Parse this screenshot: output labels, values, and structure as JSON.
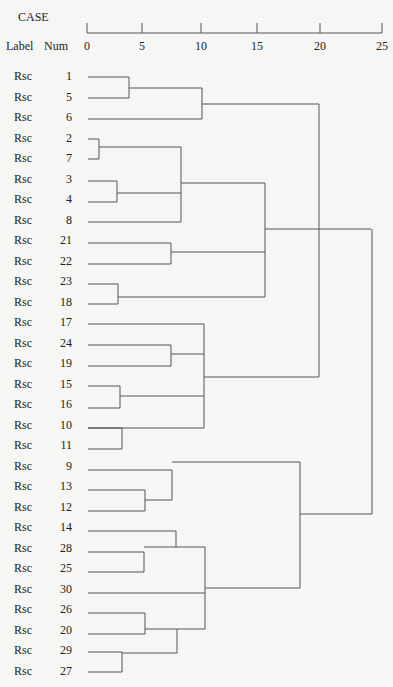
{
  "header": {
    "case_label": "CASE",
    "label_col": "Label",
    "num_col": "Num"
  },
  "chart_data": {
    "type": "dendrogram",
    "title": "",
    "axis": {
      "label": "Rescaled distance",
      "ticks": [
        0,
        5,
        10,
        15,
        20,
        25
      ],
      "range": [
        0,
        25
      ]
    },
    "leaves": [
      {
        "label": "Rsc",
        "num": "1"
      },
      {
        "label": "Rsc",
        "num": "5"
      },
      {
        "label": "Rsc",
        "num": "6"
      },
      {
        "label": "Rsc",
        "num": "2"
      },
      {
        "label": "Rsc",
        "num": "7"
      },
      {
        "label": "Rsc",
        "num": "3"
      },
      {
        "label": "Rsc",
        "num": "4"
      },
      {
        "label": "Rsc",
        "num": "8"
      },
      {
        "label": "Rsc",
        "num": "21"
      },
      {
        "label": "Rsc",
        "num": "22"
      },
      {
        "label": "Rsc",
        "num": "23"
      },
      {
        "label": "Rsc",
        "num": "18"
      },
      {
        "label": "Rsc",
        "num": "17"
      },
      {
        "label": "Rsc",
        "num": "24"
      },
      {
        "label": "Rsc",
        "num": "19"
      },
      {
        "label": "Rsc",
        "num": "15"
      },
      {
        "label": "Rsc",
        "num": "16"
      },
      {
        "label": "Rsc",
        "num": "10"
      },
      {
        "label": "Rsc",
        "num": "11"
      },
      {
        "label": "Rsc",
        "num": "9"
      },
      {
        "label": "Rsc",
        "num": "13"
      },
      {
        "label": "Rsc",
        "num": "12"
      },
      {
        "label": "Rsc",
        "num": "14"
      },
      {
        "label": "Rsc",
        "num": "28"
      },
      {
        "label": "Rsc",
        "num": "25"
      },
      {
        "label": "Rsc",
        "num": "30"
      },
      {
        "label": "Rsc",
        "num": "26"
      },
      {
        "label": "Rsc",
        "num": "20"
      },
      {
        "label": "Rsc",
        "num": "29"
      },
      {
        "label": "Rsc",
        "num": "27"
      }
    ],
    "merges": [
      {
        "members": [
          "1",
          "5"
        ],
        "distance": 3.7
      },
      {
        "members": [
          "1,5",
          "6"
        ],
        "distance": 10.0
      },
      {
        "members": [
          "2",
          "7"
        ],
        "distance": 1.0
      },
      {
        "members": [
          "3",
          "4"
        ],
        "distance": 2.6
      },
      {
        "members": [
          "2,7",
          "3,4",
          "8"
        ],
        "distance": 8.3
      },
      {
        "members": [
          "21",
          "22"
        ],
        "distance": 7.4
      },
      {
        "members": [
          "23",
          "18"
        ],
        "distance": 2.7
      },
      {
        "members": [
          "2..8",
          "21,22",
          "23,18"
        ],
        "distance": 15.5
      },
      {
        "members": [
          "24",
          "19"
        ],
        "distance": 7.4
      },
      {
        "members": [
          "15",
          "16"
        ],
        "distance": 2.9
      },
      {
        "members": [
          "10",
          "11"
        ],
        "distance": 3.0
      },
      {
        "members": [
          "17",
          "24,19",
          "15,16",
          "10,11"
        ],
        "distance": 10.2
      },
      {
        "members": [
          "1,5,6",
          "17..11"
        ],
        "distance": 20.4
      },
      {
        "members": [
          "13",
          "12"
        ],
        "distance": 5.0
      },
      {
        "members": [
          "9",
          "13,12"
        ],
        "distance": 7.6
      },
      {
        "members": [
          "28",
          "25"
        ],
        "distance": 4.9
      },
      {
        "members": [
          "14",
          "28,25"
        ],
        "distance": 7.9
      },
      {
        "members": [
          "26",
          "20"
        ],
        "distance": 5.0
      },
      {
        "members": [
          "29",
          "27"
        ],
        "distance": 3.0
      },
      {
        "members": [
          "26,20",
          "29,27"
        ],
        "distance": 7.9
      },
      {
        "members": [
          "14,28,25",
          "30",
          "26..27"
        ],
        "distance": 10.3
      },
      {
        "members": [
          "9,13,12",
          "14..27"
        ],
        "distance": 18.7
      },
      {
        "members": [
          "upper",
          "lower"
        ],
        "distance": 24.8
      }
    ],
    "segments": [
      [
        88,
        77,
        129,
        77
      ],
      [
        88,
        98,
        129,
        98
      ],
      [
        129,
        77,
        129,
        98
      ],
      [
        129,
        88,
        202,
        88
      ],
      [
        88,
        119,
        202,
        119
      ],
      [
        202,
        88,
        202,
        119
      ],
      [
        202,
        104,
        319,
        104
      ],
      [
        88,
        139,
        99,
        139
      ],
      [
        88,
        159,
        99,
        159
      ],
      [
        99,
        139,
        99,
        159
      ],
      [
        99,
        147,
        181,
        147
      ],
      [
        88,
        181,
        117,
        181
      ],
      [
        88,
        202,
        117,
        202
      ],
      [
        117,
        181,
        117,
        202
      ],
      [
        117,
        193,
        181,
        193
      ],
      [
        88,
        222,
        181,
        222
      ],
      [
        181,
        147,
        181,
        222
      ],
      [
        181,
        183,
        265,
        183
      ],
      [
        88,
        243,
        171,
        243
      ],
      [
        88,
        264,
        171,
        264
      ],
      [
        171,
        243,
        171,
        264
      ],
      [
        171,
        252,
        265,
        252
      ],
      [
        88,
        284,
        118,
        284
      ],
      [
        88,
        304,
        118,
        304
      ],
      [
        118,
        284,
        118,
        304
      ],
      [
        118,
        297,
        265,
        297
      ],
      [
        265,
        183,
        265,
        297
      ],
      [
        265,
        229,
        371,
        229
      ],
      [
        88,
        324,
        204,
        324
      ],
      [
        88,
        345,
        171,
        345
      ],
      [
        88,
        366,
        171,
        366
      ],
      [
        171,
        345,
        171,
        366
      ],
      [
        171,
        354,
        204,
        354
      ],
      [
        88,
        386,
        120,
        386
      ],
      [
        88,
        408,
        120,
        408
      ],
      [
        120,
        386,
        120,
        408
      ],
      [
        120,
        396,
        204,
        396
      ],
      [
        88,
        428,
        122,
        428
      ],
      [
        88,
        449,
        122,
        449
      ],
      [
        122,
        428,
        122,
        449
      ],
      [
        88,
        428,
        204,
        428
      ],
      [
        204,
        324,
        204,
        428
      ],
      [
        204,
        377,
        319,
        377
      ],
      [
        319,
        104,
        319,
        377
      ],
      [
        88,
        470,
        172,
        470
      ],
      [
        88,
        490,
        145,
        490
      ],
      [
        88,
        511,
        145,
        511
      ],
      [
        145,
        490,
        145,
        511
      ],
      [
        145,
        500,
        172,
        500
      ],
      [
        172,
        470,
        172,
        500
      ],
      [
        172,
        462,
        300,
        462
      ],
      [
        88,
        531,
        176,
        531
      ],
      [
        88,
        552,
        144,
        552
      ],
      [
        88,
        572,
        144,
        572
      ],
      [
        144,
        552,
        144,
        572
      ],
      [
        144,
        547,
        176,
        547
      ],
      [
        176,
        531,
        176,
        547
      ],
      [
        88,
        593,
        205,
        593
      ],
      [
        88,
        613,
        145,
        613
      ],
      [
        88,
        634,
        145,
        634
      ],
      [
        145,
        613,
        145,
        634
      ],
      [
        145,
        629,
        177,
        629
      ],
      [
        88,
        652,
        122,
        652
      ],
      [
        88,
        672,
        122,
        672
      ],
      [
        122,
        652,
        122,
        672
      ],
      [
        122,
        653,
        177,
        653
      ],
      [
        177,
        629,
        177,
        653
      ],
      [
        176,
        547,
        205,
        547
      ],
      [
        205,
        547,
        205,
        629
      ],
      [
        177,
        629,
        205,
        629
      ],
      [
        205,
        588,
        300,
        588
      ],
      [
        300,
        462,
        300,
        588
      ],
      [
        300,
        514,
        372,
        514
      ],
      [
        372,
        229,
        372,
        514
      ]
    ]
  },
  "layout": {
    "axis_y": 33,
    "tick_x": [
      87,
      142,
      201,
      257,
      320,
      382
    ],
    "row_start_y": 77,
    "row_step": 20.5
  }
}
